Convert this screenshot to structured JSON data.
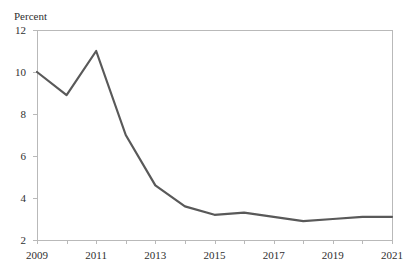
{
  "title_remnant": "",
  "axis": {
    "y_title": "Percent",
    "y_ticks": [
      "2",
      "4",
      "6",
      "8",
      "10",
      "12"
    ],
    "x_ticks": [
      "2009",
      "2011",
      "2013",
      "2015",
      "2017",
      "2019",
      "2021"
    ]
  },
  "colors": {
    "line": "#595959",
    "axis": "#b9b9b9",
    "text": "#2f2f2f",
    "background": "#ffffff"
  },
  "chart_data": {
    "type": "line",
    "title": "",
    "xlabel": "",
    "ylabel": "Percent",
    "ylim": [
      2,
      12
    ],
    "xlim": [
      2009,
      2021
    ],
    "grid": false,
    "legend": "none",
    "y_tick_values": [
      2,
      4,
      6,
      8,
      10,
      12
    ],
    "x_tick_values": [
      2009,
      2011,
      2013,
      2015,
      2017,
      2019,
      2021
    ],
    "x_minor_tick_values": [
      2010,
      2012,
      2014,
      2016,
      2018,
      2020
    ],
    "x": [
      2009,
      2010,
      2011,
      2012,
      2013,
      2014,
      2015,
      2016,
      2017,
      2018,
      2019,
      2020,
      2021
    ],
    "series": [
      {
        "name": "Percent",
        "color": "#595959",
        "values": [
          10.0,
          8.9,
          11.0,
          7.0,
          4.6,
          3.6,
          3.2,
          3.3,
          3.1,
          2.9,
          3.0,
          3.1,
          3.1
        ]
      }
    ]
  }
}
